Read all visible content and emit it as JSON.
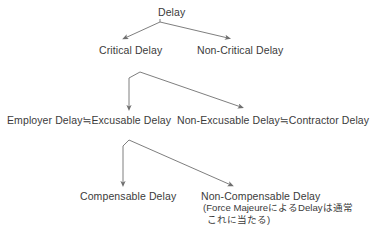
{
  "diagram": {
    "type": "tree",
    "text_color": "#3b3b3b",
    "edge_color": "#6f6f6f",
    "background": "#ffffff",
    "approx_equal_symbol": "≒",
    "nodes": {
      "root": "Delay",
      "critical": "Critical Delay",
      "non_critical": "Non-Critical Delay",
      "employer": "Employer Delay≒Excusable Delay",
      "non_excusable": "Non-Excusable Delay≒Contractor Delay",
      "compensable": "Compensable Delay",
      "non_compensable": "Non-Compensable Delay"
    },
    "note": {
      "line1": "(Force MajeureによるDelayは通常",
      "line2": "これに当たる)"
    },
    "edges": [
      {
        "from": "root",
        "to": "critical"
      },
      {
        "from": "root",
        "to": "non_critical"
      },
      {
        "from": "critical",
        "to": "employer"
      },
      {
        "from": "critical",
        "to": "non_excusable"
      },
      {
        "from": "employer",
        "to": "compensable"
      },
      {
        "from": "employer",
        "to": "non_compensable"
      }
    ]
  }
}
